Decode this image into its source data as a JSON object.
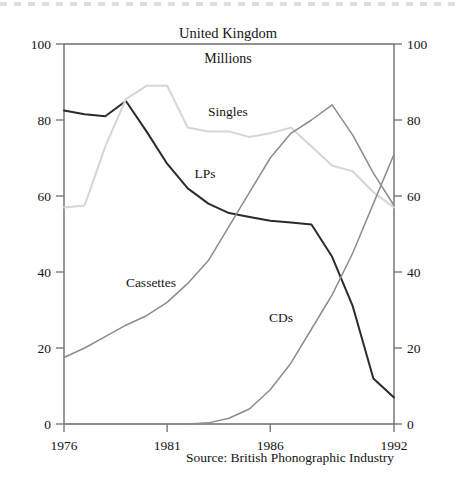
{
  "header": {
    "title": "United Kingdom",
    "subtitle": "Millions"
  },
  "footer": {
    "source": "Source: British Phonographic Industry"
  },
  "axes": {
    "left_ticks": [
      "0",
      "20",
      "40",
      "60",
      "80",
      "100"
    ],
    "right_ticks": [
      "0",
      "20",
      "40",
      "60",
      "80",
      "100"
    ],
    "x_ticks": [
      "1976",
      "1981",
      "1986",
      "1992"
    ]
  },
  "series_labels": {
    "singles": "Singles",
    "lps": "LPs",
    "cassettes": "Cassettes",
    "cds": "CDs"
  },
  "colors": {
    "lps": "#2b2b2b",
    "singles": "#d6d6d6",
    "cassettes": "#8c8c8c",
    "cds": "#8c8c8c",
    "axis": "#6d6d6d",
    "text": "#141414",
    "background": "#ffffff"
  },
  "chart_data": {
    "type": "line",
    "title": "United Kingdom",
    "subtitle": "Millions",
    "xlabel": "",
    "ylabel": "Millions",
    "xlim": [
      1976,
      1992
    ],
    "ylim": [
      0,
      100
    ],
    "yticks": [
      0,
      20,
      40,
      60,
      80,
      100
    ],
    "xticks": [
      1976,
      1981,
      1986,
      1992
    ],
    "grid": false,
    "legend": "inline-labels",
    "x": [
      1976,
      1977,
      1978,
      1979,
      1980,
      1981,
      1982,
      1983,
      1984,
      1985,
      1986,
      1987,
      1988,
      1989,
      1990,
      1991,
      1992
    ],
    "series": [
      {
        "name": "LPs",
        "color": "#2b2b2b",
        "values": [
          82.5,
          81.5,
          81.0,
          85.0,
          77.0,
          68.5,
          62.0,
          58.0,
          55.5,
          54.5,
          53.5,
          53.0,
          52.5,
          44.0,
          31.0,
          12.0,
          7.0
        ]
      },
      {
        "name": "Singles",
        "color": "#d6d6d6",
        "values": [
          57.0,
          57.5,
          73.0,
          85.5,
          89.0,
          89.0,
          78.0,
          77.0,
          77.0,
          75.5,
          76.5,
          78.0,
          73.0,
          68.0,
          66.5,
          61.0,
          57.0
        ]
      },
      {
        "name": "Cassettes",
        "color": "#8c8c8c",
        "values": [
          17.5,
          20.0,
          23.0,
          26.0,
          28.5,
          32.0,
          37.0,
          43.0,
          52.0,
          61.0,
          70.0,
          76.5,
          80.0,
          84.0,
          76.0,
          66.0,
          57.5
        ]
      },
      {
        "name": "CDs",
        "color": "#8c8c8c",
        "values": [
          0.0,
          0.0,
          0.0,
          0.0,
          0.0,
          0.0,
          0.0,
          0.3,
          1.5,
          4.0,
          9.0,
          16.0,
          25.0,
          34.0,
          45.0,
          58.0,
          71.0
        ]
      }
    ]
  },
  "geometry": {
    "plot_left": 64,
    "plot_right": 394,
    "plot_top": 44,
    "plot_bottom": 424
  }
}
